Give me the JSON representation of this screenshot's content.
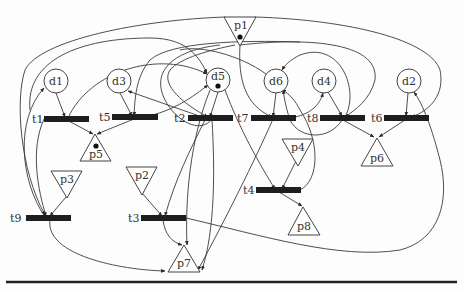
{
  "diagram": {
    "type": "petri-net",
    "places_circle": [
      {
        "id": "d1",
        "label": "d1",
        "x": 56,
        "y": 81,
        "r": 12,
        "token": false
      },
      {
        "id": "d3",
        "label": "d3",
        "x": 119,
        "y": 81,
        "r": 12,
        "token": false
      },
      {
        "id": "d5",
        "label": "d5",
        "x": 218,
        "y": 80,
        "r": 12,
        "token": true
      },
      {
        "id": "d6",
        "label": "d6",
        "x": 276,
        "y": 81,
        "r": 12,
        "token": false
      },
      {
        "id": "d4",
        "label": "d4",
        "x": 324,
        "y": 81,
        "r": 12,
        "token": false
      },
      {
        "id": "d2",
        "label": "d2",
        "x": 409,
        "y": 81,
        "r": 12,
        "token": false
      }
    ],
    "places_triangle_down": [
      {
        "id": "p1",
        "label": "p1",
        "x": 240,
        "y": 30,
        "token": true
      },
      {
        "id": "p3",
        "label": "p3",
        "x": 66,
        "y": 185,
        "token": false
      },
      {
        "id": "p2",
        "label": "p2",
        "x": 142,
        "y": 181,
        "token": false
      },
      {
        "id": "p4",
        "label": "p4",
        "x": 298,
        "y": 145,
        "token": false
      }
    ],
    "places_triangle_up": [
      {
        "id": "p5",
        "label": "p5",
        "x": 95,
        "y": 148,
        "token": true
      },
      {
        "id": "p6",
        "label": "p6",
        "x": 377,
        "y": 151,
        "token": false
      },
      {
        "id": "p8",
        "label": "p8",
        "x": 303,
        "y": 222,
        "token": false
      },
      {
        "id": "p7",
        "label": "p7",
        "x": 184,
        "y": 260,
        "token": false
      }
    ],
    "transitions": [
      {
        "id": "t1",
        "label": "t1",
        "x": 44,
        "y": 119,
        "w": 45,
        "label_x": 32
      },
      {
        "id": "t5",
        "label": "t5",
        "x": 112,
        "y": 117,
        "w": 46,
        "label_x": 99
      },
      {
        "id": "t2",
        "label": "t2",
        "x": 188,
        "y": 118,
        "w": 45,
        "label_x": 174
      },
      {
        "id": "t7",
        "label": "t7",
        "x": 251,
        "y": 118,
        "w": 45,
        "label_x": 237
      },
      {
        "id": "t8",
        "label": "t8",
        "x": 320,
        "y": 118,
        "w": 45,
        "label_x": 307
      },
      {
        "id": "t6",
        "label": "t6",
        "x": 384,
        "y": 118,
        "w": 45,
        "label_x": 371
      },
      {
        "id": "t4",
        "label": "t4",
        "x": 256,
        "y": 190,
        "w": 45,
        "label_x": 243
      },
      {
        "id": "t9",
        "label": "t9",
        "x": 26,
        "y": 218,
        "w": 45,
        "label_x": 10
      },
      {
        "id": "t3",
        "label": "t3",
        "x": 141,
        "y": 218,
        "w": 45,
        "label_x": 128
      }
    ],
    "colors": {
      "stroke": "#3a3a3a",
      "transition_fill": "#1e1e1e",
      "background": "#fdfdfd"
    }
  }
}
